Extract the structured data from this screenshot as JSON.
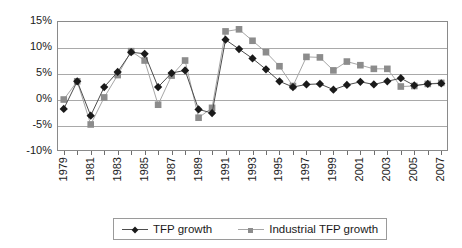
{
  "chart_data": {
    "type": "line",
    "title": "",
    "subtitle": "",
    "xlabel": "",
    "ylabel": "",
    "x": [
      1979,
      1980,
      1981,
      1982,
      1983,
      1984,
      1985,
      1986,
      1987,
      1988,
      1989,
      1990,
      1991,
      1992,
      1993,
      1994,
      1995,
      1996,
      1997,
      1998,
      1999,
      2000,
      2001,
      2002,
      2003,
      2004,
      2005,
      2006,
      2007
    ],
    "xlim": [
      1978.5,
      2007.5
    ],
    "ylim": [
      -10,
      15
    ],
    "ytick_values": [
      15,
      10,
      5,
      0,
      -5,
      -10
    ],
    "ytick_labels": [
      "15%",
      "10%",
      "5%",
      "0%",
      "-5%",
      "-10%"
    ],
    "xtick_labels": [
      "1979",
      "1981",
      "1983",
      "1985",
      "1987",
      "1989",
      "1991",
      "1993",
      "1995",
      "1997",
      "1999",
      "2001",
      "2003",
      "2005",
      "2007"
    ],
    "xtick_label_every": 2,
    "grid": true,
    "grid_axis": "y",
    "legend_position": "bottom",
    "series": [
      {
        "name": "TFP growth",
        "marker": "diamond",
        "color": "#1a1a1a",
        "line_color": "#4d4d4d",
        "values": [
          -1.9,
          3.4,
          -3.2,
          2.3,
          5.2,
          9.0,
          8.7,
          2.3,
          5.0,
          5.5,
          -2.0,
          -2.7,
          11.4,
          9.6,
          7.8,
          5.7,
          3.4,
          2.3,
          2.8,
          2.9,
          1.8,
          2.7,
          3.3,
          2.8,
          3.4,
          4.0,
          2.6,
          2.9,
          3.0
        ]
      },
      {
        "name": "Industrial TFP growth",
        "marker": "square",
        "color": "#8c8c8c",
        "line_color": "#a6a6a6",
        "values": [
          -0.1,
          3.4,
          -4.9,
          0.3,
          4.6,
          9.2,
          7.4,
          -1.1,
          4.5,
          7.4,
          -3.6,
          -1.7,
          13.0,
          13.4,
          11.2,
          9.0,
          6.3,
          2.5,
          8.1,
          8.0,
          5.5,
          7.2,
          6.5,
          5.8,
          5.8,
          2.4,
          2.5,
          2.9,
          3.1
        ]
      }
    ]
  },
  "legend": {
    "entries": [
      {
        "label": "TFP growth",
        "marker": "diamond-marker",
        "color": "#1a1a1a"
      },
      {
        "label": "Industrial TFP growth",
        "marker": "square-marker",
        "color": "#8c8c8c"
      }
    ]
  }
}
